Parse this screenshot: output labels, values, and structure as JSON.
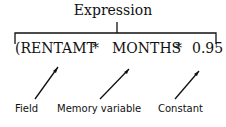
{
  "title": "Expression",
  "expression": {
    "tokens": [
      "(RENTAMT",
      "*",
      "MONTHS",
      "*",
      "0.95"
    ]
  },
  "labels": {
    "field": "Field",
    "memory_variable": "Memory variable",
    "constant": "Constant"
  }
}
